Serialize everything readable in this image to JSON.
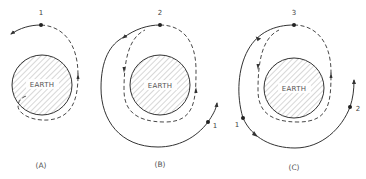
{
  "figure": {
    "panels": [
      {
        "id": "A",
        "caption": "(A)",
        "earth_label": "EARTH",
        "points": [
          {
            "label": "1"
          }
        ]
      },
      {
        "id": "B",
        "caption": "(B)",
        "earth_label": "EARTH",
        "points": [
          {
            "label": "2"
          },
          {
            "label": "1"
          }
        ]
      },
      {
        "id": "C",
        "caption": "(C)",
        "earth_label": "EARTH",
        "points": [
          {
            "label": "3"
          },
          {
            "label": "1"
          },
          {
            "label": "2"
          }
        ]
      }
    ],
    "colors": {
      "line": "#333333",
      "hatch": "#999999",
      "text": "#555555",
      "background": "#ffffff"
    }
  }
}
